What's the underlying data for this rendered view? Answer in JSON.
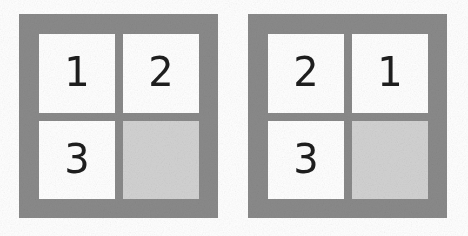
{
  "figure": {
    "background_color": "#ffffff",
    "frame_color": "#8a8a8a",
    "tile_color": "#ffffff",
    "empty_tile_color": "#d2d2d2",
    "label_color": "#1e1e1e"
  },
  "grids": [
    {
      "name": "left-grid",
      "rows": 2,
      "columns": 2,
      "cells": [
        {
          "label": "1",
          "state": "filled",
          "position": "top-left"
        },
        {
          "label": "2",
          "state": "filled",
          "position": "top-right"
        },
        {
          "label": "3",
          "state": "filled",
          "position": "bottom-left"
        },
        {
          "label": "",
          "state": "empty",
          "position": "bottom-right"
        }
      ]
    },
    {
      "name": "right-grid",
      "rows": 2,
      "columns": 2,
      "cells": [
        {
          "label": "2",
          "state": "filled",
          "position": "top-left"
        },
        {
          "label": "1",
          "state": "filled",
          "position": "top-right"
        },
        {
          "label": "3",
          "state": "filled",
          "position": "bottom-left"
        },
        {
          "label": "",
          "state": "empty",
          "position": "bottom-right"
        }
      ]
    }
  ]
}
